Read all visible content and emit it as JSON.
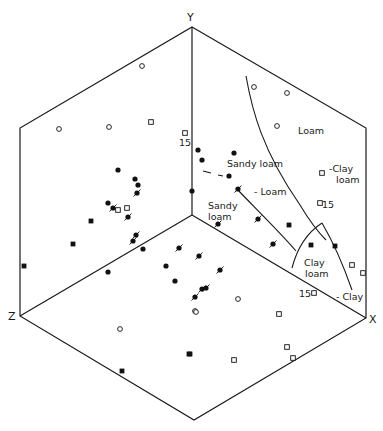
{
  "chart_data": {
    "type": "scatter",
    "subtype": "isometric-cube-projection (three faces: XY, YZ, XZ)",
    "title": "",
    "axes": {
      "x_label": "X",
      "y_label": "Y",
      "z_label": "Z"
    },
    "geometry": {
      "y_vertex": [
        192,
        27
      ],
      "center": [
        192,
        215
      ],
      "top_left": [
        20,
        128
      ],
      "top_right": [
        366,
        128
      ],
      "z_vertex": [
        20,
        316
      ],
      "x_vertex": [
        366,
        318
      ],
      "bottom": [
        194,
        420
      ]
    },
    "legend": [
      {
        "marker": "filled-circle",
        "meaning": "point class A"
      },
      {
        "marker": "open-circle",
        "meaning": "point class B"
      },
      {
        "marker": "filled-square",
        "meaning": "point class C"
      },
      {
        "marker": "open-square",
        "meaning": "point class D"
      },
      {
        "marker": "slashed-filled-circle",
        "meaning": "point class E"
      }
    ],
    "regions": [
      {
        "label": "Loam",
        "pos": [
          278,
          132
        ]
      },
      {
        "label": "Sandy loam",
        "pos": [
          226,
          166
        ]
      },
      {
        "label": "- Loam",
        "pos": [
          252,
          193
        ]
      },
      {
        "label": "Sandy",
        "pos": [
          207,
          208
        ]
      },
      {
        "label": "loam",
        "pos": [
          207,
          219
        ]
      },
      {
        "label": "-Clay",
        "pos": [
          331,
          170
        ]
      },
      {
        "label": "loam",
        "pos": [
          336,
          181
        ]
      },
      {
        "label": "Clay",
        "pos": [
          305,
          264
        ]
      },
      {
        "label": "loam",
        "pos": [
          307,
          275
        ]
      },
      {
        "label": "- Clay",
        "pos": [
          337,
          299
        ]
      }
    ],
    "annotations": [
      {
        "text": "15",
        "pos": [
          180,
          143
        ]
      },
      {
        "text": "15",
        "pos": [
          323,
          207
        ]
      },
      {
        "text": "15",
        "pos": [
          302,
          296
        ]
      }
    ],
    "points": {
      "filled_circle": [
        [
          198,
          150
        ],
        [
          202,
          160
        ],
        [
          234,
          153
        ],
        [
          229,
          176
        ],
        [
          118,
          170
        ],
        [
          135,
          179
        ],
        [
          138,
          185
        ],
        [
          108,
          203
        ],
        [
          143,
          249
        ],
        [
          108,
          272
        ],
        [
          166,
          266
        ],
        [
          175,
          281
        ],
        [
          192,
          191
        ]
      ],
      "open_circle": [
        [
          142,
          66
        ],
        [
          59,
          129
        ],
        [
          109,
          127
        ],
        [
          254,
          87
        ],
        [
          287,
          93
        ],
        [
          277,
          126
        ],
        [
          238,
          299
        ],
        [
          195,
          311
        ],
        [
          120,
          329
        ],
        [
          196,
          312
        ]
      ],
      "filled_square": [
        [
          91,
          221
        ],
        [
          73,
          244
        ],
        [
          24,
          266
        ],
        [
          289,
          225
        ],
        [
          311,
          245
        ],
        [
          335,
          246
        ],
        [
          189,
          354
        ],
        [
          122,
          371
        ],
        [
          190,
          354
        ]
      ],
      "open_square": [
        [
          151,
          122
        ],
        [
          185,
          133
        ],
        [
          118,
          210
        ],
        [
          127,
          208
        ],
        [
          322,
          173
        ],
        [
          320,
          203
        ],
        [
          352,
          265
        ],
        [
          363,
          273
        ],
        [
          314,
          293
        ],
        [
          279,
          314
        ],
        [
          287,
          347
        ],
        [
          293,
          358
        ],
        [
          234,
          360
        ]
      ],
      "slashed_filled_circle": [
        [
          113,
          208
        ],
        [
          128,
          217
        ],
        [
          137,
          193
        ],
        [
          238,
          189
        ],
        [
          218,
          224
        ],
        [
          136,
          235
        ],
        [
          133,
          241
        ],
        [
          258,
          219
        ],
        [
          179,
          248
        ],
        [
          273,
          244
        ],
        [
          199,
          256
        ],
        [
          195,
          297
        ],
        [
          202,
          289
        ],
        [
          206,
          288
        ],
        [
          220,
          270
        ]
      ]
    },
    "grid": false
  },
  "labels": {
    "y": "Y",
    "x": "X",
    "z": "Z",
    "loam": "Loam",
    "sandy_loam_top": "Sandy loam",
    "loam_dash": "- Loam",
    "sandy": "Sandy",
    "loam_sub": "loam",
    "clay_dash_top": "-Clay",
    "clay_loam_sub_top": "loam",
    "clay": "Clay",
    "clay_loam_sub": "loam",
    "clay_dash": "- Clay",
    "n15_a": "15",
    "n15_b": "15",
    "n15_c": "15"
  }
}
